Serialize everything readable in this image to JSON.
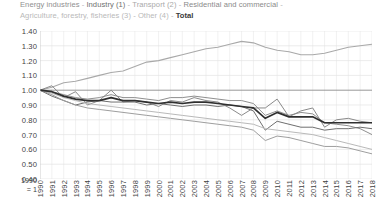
{
  "legend": {
    "separator": "-",
    "items": [
      {
        "label": "Energy industries",
        "color": "#8f8f8f",
        "cls": "lg-energy"
      },
      {
        "label": "Industry (1)",
        "color": "#6f6f6f",
        "cls": "lg-industry"
      },
      {
        "label": "Transport (2)",
        "color": "#a9a9a9",
        "cls": "lg-transport"
      },
      {
        "label": "Residential and commercial",
        "color": "#8a8a8a",
        "cls": "lg-resid"
      },
      {
        "label": "Agriculture, forestry, fisheries (3)",
        "color": "#b9b9b9",
        "cls": "lg-agri"
      },
      {
        "label": "Other (4)",
        "color": "#9e9e9e",
        "cls": "lg-agri"
      },
      {
        "label": "Total",
        "color": "#2f2f2f",
        "cls": "lg-total"
      }
    ]
  },
  "axis_note": {
    "line1": "1990",
    "line2": "= 1"
  },
  "chart_data": {
    "type": "line",
    "title": "",
    "subtitle": "",
    "xlabel": "",
    "ylabel": "",
    "ylim": [
      0.4,
      1.4
    ],
    "ytick_step": 0.1,
    "ytick_labels": [
      "1.40",
      "1.30",
      "1.20",
      "1.10",
      "1.00",
      "0.90",
      "0.80",
      "0.70",
      "0.60",
      "0.50",
      "0.40"
    ],
    "grid": true,
    "grid_vertical": true,
    "legend_position": "top",
    "index_base": "1990 = 1",
    "x": [
      1990,
      1991,
      1992,
      1993,
      1994,
      1995,
      1996,
      1997,
      1998,
      1999,
      2000,
      2001,
      2002,
      2003,
      2004,
      2005,
      2006,
      2007,
      2008,
      2009,
      2010,
      2011,
      2012,
      2013,
      2014,
      2015,
      2016,
      2017,
      2018
    ],
    "series": [
      {
        "name": "Energy industries",
        "color": "#8f8f8f",
        "width": 1.0,
        "values": [
          1.0,
          0.99,
          0.97,
          0.95,
          0.94,
          0.95,
          0.97,
          0.95,
          0.95,
          0.94,
          0.93,
          0.95,
          0.95,
          0.96,
          0.95,
          0.94,
          0.93,
          0.93,
          0.91,
          0.83,
          0.86,
          0.83,
          0.85,
          0.84,
          0.78,
          0.77,
          0.76,
          0.74,
          0.7
        ]
      },
      {
        "name": "Industry (1)",
        "color": "#6f6f6f",
        "width": 1.0,
        "values": [
          1.0,
          0.96,
          0.93,
          0.9,
          0.92,
          0.93,
          0.92,
          0.92,
          0.92,
          0.9,
          0.91,
          0.9,
          0.89,
          0.9,
          0.9,
          0.89,
          0.9,
          0.89,
          0.86,
          0.73,
          0.79,
          0.77,
          0.75,
          0.75,
          0.73,
          0.74,
          0.74,
          0.75,
          0.74
        ]
      },
      {
        "name": "Transport (2)",
        "color": "#a9a9a9",
        "width": 1.1,
        "values": [
          1.0,
          1.02,
          1.05,
          1.06,
          1.08,
          1.1,
          1.12,
          1.13,
          1.16,
          1.19,
          1.2,
          1.22,
          1.24,
          1.26,
          1.28,
          1.29,
          1.31,
          1.33,
          1.32,
          1.29,
          1.27,
          1.26,
          1.24,
          1.24,
          1.25,
          1.27,
          1.29,
          1.3,
          1.31
        ]
      },
      {
        "name": "Residential and commercial",
        "color": "#8a8a8a",
        "width": 1.0,
        "values": [
          1.0,
          1.03,
          0.95,
          0.99,
          0.9,
          0.93,
          1.0,
          0.92,
          0.93,
          0.92,
          0.89,
          0.93,
          0.92,
          0.95,
          0.93,
          0.92,
          0.88,
          0.83,
          0.88,
          0.88,
          0.94,
          0.82,
          0.86,
          0.88,
          0.75,
          0.8,
          0.81,
          0.79,
          0.78
        ]
      },
      {
        "name": "Agriculture, forestry, fisheries (3)",
        "color": "#b9b9b9",
        "width": 1.0,
        "values": [
          1.0,
          0.98,
          0.95,
          0.93,
          0.91,
          0.9,
          0.89,
          0.88,
          0.87,
          0.86,
          0.85,
          0.84,
          0.83,
          0.82,
          0.81,
          0.8,
          0.79,
          0.78,
          0.77,
          0.74,
          0.73,
          0.72,
          0.71,
          0.7,
          0.68,
          0.66,
          0.64,
          0.62,
          0.6
        ]
      },
      {
        "name": "Other (4)",
        "color": "#9e9e9e",
        "width": 1.0,
        "values": [
          1.0,
          0.97,
          0.93,
          0.9,
          0.88,
          0.87,
          0.86,
          0.85,
          0.84,
          0.83,
          0.82,
          0.81,
          0.8,
          0.79,
          0.78,
          0.77,
          0.76,
          0.75,
          0.73,
          0.66,
          0.69,
          0.68,
          0.66,
          0.64,
          0.62,
          0.62,
          0.61,
          0.59,
          0.57
        ]
      },
      {
        "name": "Total",
        "color": "#2f2f2f",
        "width": 1.7,
        "values": [
          1.0,
          0.99,
          0.96,
          0.94,
          0.93,
          0.93,
          0.95,
          0.93,
          0.93,
          0.92,
          0.91,
          0.92,
          0.91,
          0.92,
          0.92,
          0.91,
          0.9,
          0.89,
          0.88,
          0.81,
          0.85,
          0.82,
          0.82,
          0.82,
          0.78,
          0.78,
          0.78,
          0.78,
          0.78
        ]
      }
    ]
  }
}
